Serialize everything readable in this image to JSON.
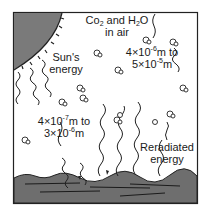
{
  "diagram": {
    "labels": {
      "gases_line1_a": "Co",
      "gases_line1_sub": "2",
      "gases_line1_b": " and H",
      "gases_line1_sub2": "2",
      "gases_line1_c": "O",
      "gases_line2": "in air",
      "sun_line1": "Sun's",
      "sun_line2": "energy",
      "ir_range_a": "4×10",
      "ir_range_exp1": "-6",
      "ir_range_b": "m to",
      "ir_range_c": "5×10",
      "ir_range_exp2": "-5",
      "ir_range_d": "m",
      "solar_range_a": "4×10",
      "solar_range_exp1": "-7",
      "solar_range_b": "m to",
      "solar_range_c": "3×10",
      "solar_range_exp2": "-6",
      "solar_range_d": "m",
      "reradiated_line1": "Reradiated",
      "reradiated_line2": "energy"
    },
    "colors": {
      "sun": "#7a7a7a",
      "ground": "#6e6e6e",
      "frame": "#222222",
      "ink": "#1a1a1a"
    }
  }
}
